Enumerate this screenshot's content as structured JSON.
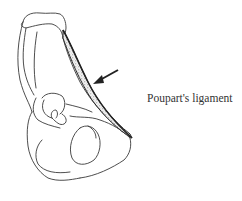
{
  "figure": {
    "label": "Poupart's ligament",
    "colors": {
      "line": "#3a3a3a",
      "ligament_stipple": "#888888",
      "text": "#333333",
      "background": "#ffffff"
    }
  }
}
